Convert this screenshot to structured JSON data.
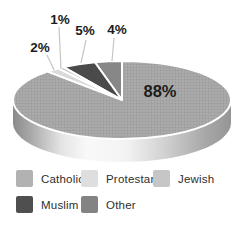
{
  "figure": {
    "background": "#ffffff"
  },
  "chart_data": {
    "type": "pie",
    "style": "3d-pie",
    "title": "",
    "categories": [
      "Catholic",
      "Protestant",
      "Jewish",
      "Muslim",
      "Other"
    ],
    "values": [
      88,
      2,
      1,
      5,
      4
    ],
    "unit": "%",
    "legend_position": "bottom",
    "slices_draw_order": [
      {
        "name": "Other",
        "value": 4,
        "label": "4%",
        "color": "#878787",
        "callout": {
          "label_x": 117,
          "label_y": 29,
          "x1": 114,
          "y1": 38,
          "x2": 112,
          "y2": 61
        }
      },
      {
        "name": "Muslim",
        "value": 5,
        "label": "5%",
        "color": "#4a4a4a",
        "callout": {
          "label_x": 85,
          "label_y": 30,
          "x1": 86,
          "y1": 40,
          "x2": 81,
          "y2": 63
        }
      },
      {
        "name": "Jewish",
        "value": 1,
        "label": "1%",
        "color": "#c8c8c8",
        "callout": {
          "label_x": 60,
          "label_y": 19,
          "x1": 59,
          "y1": 27,
          "x2": 61,
          "y2": 69
        }
      },
      {
        "name": "Protestant",
        "value": 2,
        "label": "2%",
        "color": "#dadada",
        "callout": {
          "label_x": 40,
          "label_y": 47,
          "x1": 47,
          "y1": 55,
          "x2": 54,
          "y2": 70
        }
      },
      {
        "name": "Catholic",
        "value": 88,
        "label": "88%",
        "color": "halftone",
        "inner_label": {
          "x": 160,
          "y": 91,
          "size": 16.5
        }
      }
    ],
    "layout": {
      "cx": 122,
      "cy": 100,
      "rx": 109,
      "ry": 39,
      "depth": 23,
      "start_angle": 90,
      "direction": "ccw",
      "callout_font_size": 13.5
    },
    "colors": {
      "catholic_base": "#ababab",
      "catholic_dot": "#9a9a9a",
      "slice_stroke": "#ffffff",
      "callout_line": "#c6c6c6",
      "label_text": "#1c1c1c",
      "shadow": "#e3e3e3"
    },
    "rim_gradient": [
      {
        "offset": 0,
        "color": "#8a8a8a"
      },
      {
        "offset": 0.08,
        "color": "#a8a8a8"
      },
      {
        "offset": 0.22,
        "color": "#e4e4e4"
      },
      {
        "offset": 0.34,
        "color": "#f9f9f9"
      },
      {
        "offset": 0.52,
        "color": "#f3f3f3"
      },
      {
        "offset": 0.7,
        "color": "#d0d0d0"
      },
      {
        "offset": 0.88,
        "color": "#a8a8a8"
      },
      {
        "offset": 1,
        "color": "#959595"
      }
    ],
    "legend_items": [
      {
        "label": "Catholic",
        "color": "#b2b2b2"
      },
      {
        "label": "Protestant",
        "color": "#dedede"
      },
      {
        "label": "Jewish",
        "color": "#c6c6c6"
      },
      {
        "label": "Muslim",
        "color": "#4f4f4f"
      },
      {
        "label": "Other",
        "color": "#838383"
      }
    ]
  }
}
